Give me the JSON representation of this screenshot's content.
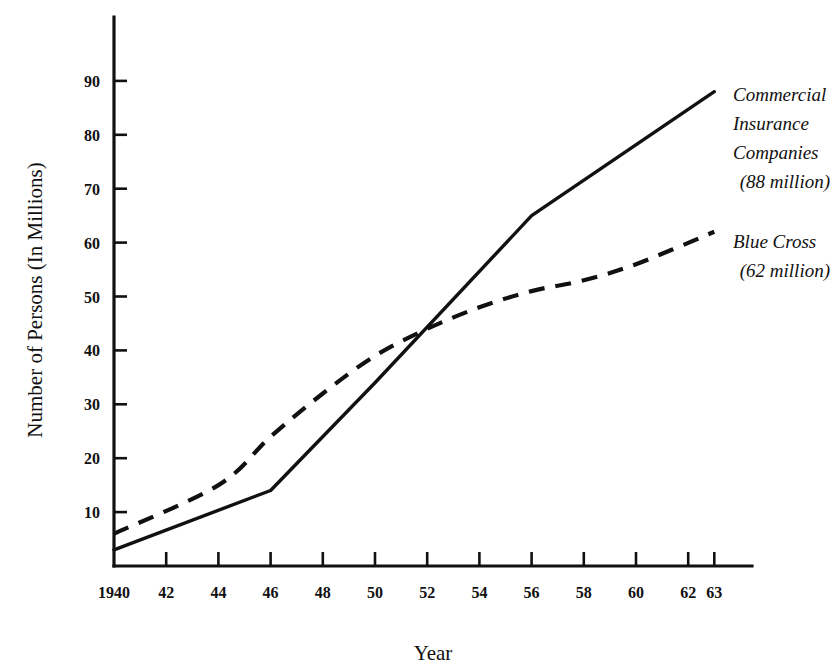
{
  "chart_data": {
    "type": "line",
    "title": "",
    "xlabel": "Year",
    "ylabel": "Number of Persons (In Millions)",
    "xlim": [
      1940,
      1963
    ],
    "ylim": [
      0,
      95
    ],
    "grid": false,
    "legend_position": "inline-right-annotations",
    "x_tick_labels": [
      "1940",
      "42",
      "44",
      "46",
      "48",
      "50",
      "52",
      "54",
      "56",
      "58",
      "60",
      "62",
      "63"
    ],
    "x_tick_values": [
      1940,
      1942,
      1944,
      1946,
      1948,
      1950,
      1952,
      1954,
      1956,
      1958,
      1960,
      1962,
      1963
    ],
    "y_tick_labels": [
      "10",
      "20",
      "30",
      "40",
      "50",
      "60",
      "70",
      "80",
      "90"
    ],
    "y_tick_values": [
      10,
      20,
      30,
      40,
      50,
      60,
      70,
      80,
      90
    ],
    "series": [
      {
        "name": "Commercial Insurance Companies",
        "style": "solid",
        "annotation_lines": [
          "Commercial",
          "Insurance",
          "Companies",
          "(88 million)"
        ],
        "final_value_label": "(88 million)",
        "x": [
          1940,
          1946,
          1950,
          1956,
          1963
        ],
        "values": [
          3,
          14,
          34,
          65,
          88
        ]
      },
      {
        "name": "Blue Cross",
        "style": "dashed",
        "annotation_lines": [
          "Blue Cross",
          "(62 million)"
        ],
        "final_value_label": "(62 million)",
        "x": [
          1940,
          1944,
          1946,
          1948,
          1950,
          1952,
          1954,
          1956,
          1958,
          1960,
          1963
        ],
        "values": [
          6,
          15,
          24,
          32,
          39,
          44,
          48,
          51,
          53,
          56,
          62
        ]
      }
    ]
  }
}
